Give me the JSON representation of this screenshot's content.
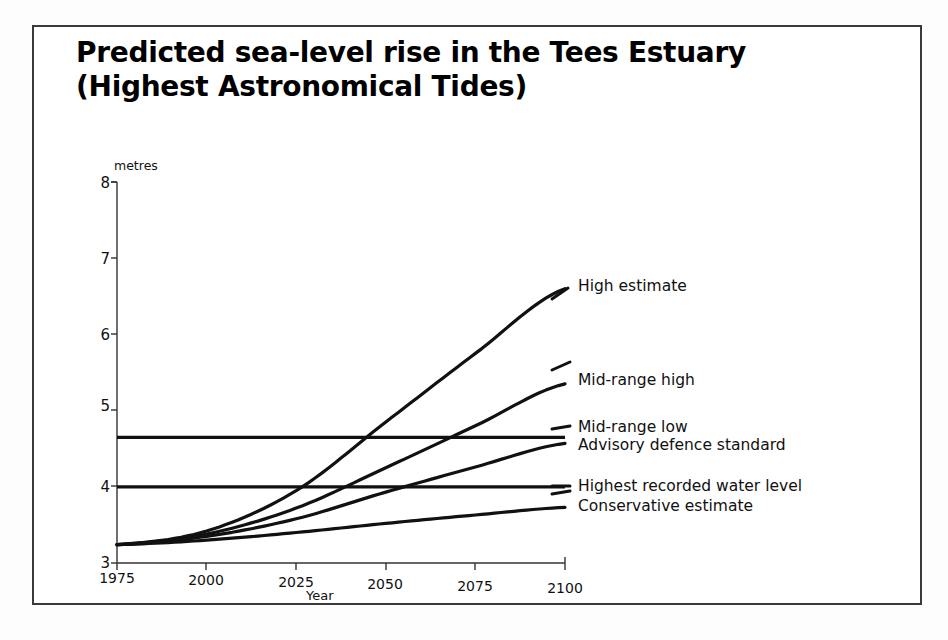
{
  "figure": {
    "title_line1": "Predicted sea-level rise in the Tees Estuary",
    "title_line2": "(Highest Astronomical Tides)",
    "title_full": "Predicted sea-level rise in the Tees Estuary\n(Highest Astronomical Tides)",
    "background_color": "#ffffff",
    "line_color": "#111111",
    "frame_color": "#3a3a3a"
  },
  "axes": {
    "units_label": "metres",
    "x_title": "Year",
    "y_ticks": [
      "8",
      "7",
      "6",
      "5",
      "4",
      "3"
    ],
    "x_ticks": [
      "1975",
      "2000",
      "2025",
      "2050",
      "2075",
      "2100"
    ]
  },
  "series_labels": {
    "high_estimate": "High estimate",
    "mid_range_high": "Mid-range high",
    "mid_range_low": "Mid-range low",
    "advisory_defence_standard": "Advisory defence standard",
    "highest_recorded_water_level": "Highest recorded water level",
    "conservative_estimate": "Conservative estimate"
  },
  "chart_data": {
    "type": "line",
    "title": "Predicted sea-level rise in the Tees Estuary (Highest Astronomical Tides)",
    "xlabel": "Year",
    "ylabel": "metres",
    "xlim": [
      1975,
      2100
    ],
    "ylim": [
      3,
      8
    ],
    "xticks": [
      1975,
      2000,
      2025,
      2050,
      2075,
      2100
    ],
    "yticks": [
      3,
      4,
      5,
      6,
      7,
      8
    ],
    "grid": false,
    "legend": "right-inline-labels",
    "x": [
      1975,
      2000,
      2025,
      2050,
      2075,
      2100
    ],
    "series": [
      {
        "name": "High estimate",
        "values": [
          3.24,
          3.42,
          3.95,
          4.85,
          5.75,
          6.6
        ],
        "end_value": 6.6,
        "style": "solid"
      },
      {
        "name": "Mid-range high",
        "values": [
          3.24,
          3.38,
          3.72,
          4.25,
          4.8,
          5.35
        ],
        "end_value": 5.35,
        "style": "solid"
      },
      {
        "name": "Mid-range low",
        "values": [
          3.24,
          3.35,
          3.58,
          3.93,
          4.26,
          4.57
        ],
        "end_value": 4.57,
        "style": "solid"
      },
      {
        "name": "Conservative estimate",
        "values": [
          3.24,
          3.3,
          3.4,
          3.52,
          3.63,
          3.73
        ],
        "end_value": 3.73,
        "style": "solid"
      }
    ],
    "reference_lines": [
      {
        "name": "Advisory defence standard",
        "value": 4.65,
        "orientation": "horizontal"
      },
      {
        "name": "Highest recorded water level",
        "value": 4.0,
        "orientation": "horizontal"
      }
    ]
  }
}
